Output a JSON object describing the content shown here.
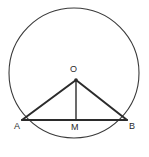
{
  "figure": {
    "kind": "circle-with-inscribed-triangle",
    "background_color": "#ffffff",
    "stroke_color": "#2b2b2b",
    "circle_stroke_color": "#3a3a3a",
    "labels": {
      "center": "O",
      "left_endpoint": "A",
      "right_endpoint": "B",
      "midpoint": "M"
    },
    "geometry": {
      "circle": {
        "cx": 74,
        "cy": 73,
        "r": 65,
        "stroke_width": 1
      },
      "center_point": {
        "x": 76,
        "y": 80
      },
      "point_a": {
        "x": 22,
        "y": 120
      },
      "point_b": {
        "x": 127,
        "y": 120
      },
      "point_m": {
        "x": 76,
        "y": 120
      },
      "chord_stroke_width": 2,
      "radius_stroke_width": 2,
      "altitude_stroke_width": 1.4,
      "center_dot_radius": 1.8
    }
  }
}
